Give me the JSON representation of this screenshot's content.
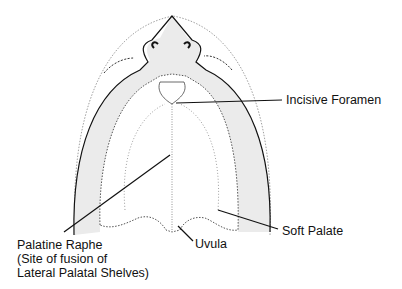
{
  "diagram": {
    "colors": {
      "background": "#ffffff",
      "gums_fill": "#ebebeb",
      "outline": "#111111",
      "dotted": "#777777"
    },
    "labels": {
      "incisive_foramen": "Incisive Foramen",
      "soft_palate": "Soft Palate",
      "uvula": "Uvula",
      "palatine_raphe_line1": "Palatine Raphe",
      "palatine_raphe_line2": "(Site of fusion of",
      "palatine_raphe_line3": "Lateral Palatal Shelves)"
    }
  }
}
